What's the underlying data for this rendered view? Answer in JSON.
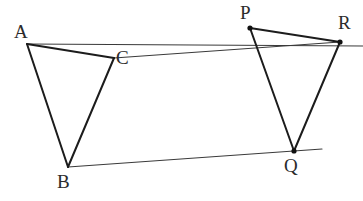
{
  "figure": {
    "kind": "geometry-diagram",
    "width": 363,
    "height": 201,
    "background_color": "#ffffff",
    "stroke_color": "#1c1c1c",
    "thin_stroke_color": "#3a3a3a",
    "label_color": "#2b2b2b",
    "thick_stroke_width": 2.0,
    "thin_stroke_width": 1.0,
    "vertex_dot_radius": 2.6,
    "points": [
      {
        "name": "A",
        "x": 27,
        "y": 44,
        "label": "A",
        "label_x": 14,
        "label_y": 22,
        "dot": false
      },
      {
        "name": "B",
        "x": 68,
        "y": 167,
        "label": "B",
        "label_x": 57,
        "label_y": 172,
        "dot": false
      },
      {
        "name": "C",
        "x": 114,
        "y": 58,
        "label": "C",
        "label_x": 116,
        "label_y": 48,
        "dot": false
      },
      {
        "name": "P",
        "x": 250,
        "y": 28,
        "label": "P",
        "label_x": 240,
        "label_y": 3,
        "dot": true
      },
      {
        "name": "Q",
        "x": 294,
        "y": 151,
        "label": "Q",
        "label_x": 284,
        "label_y": 156,
        "dot": true
      },
      {
        "name": "R",
        "x": 340,
        "y": 42,
        "label": "R",
        "label_x": 338,
        "label_y": 13,
        "dot": true
      }
    ],
    "triangles": [
      {
        "name": "triangle-ABC",
        "vertices": [
          "A",
          "B",
          "C"
        ]
      },
      {
        "name": "triangle-PQR",
        "vertices": [
          "P",
          "Q",
          "R"
        ]
      }
    ],
    "guide_lines": [
      {
        "name": "upper-parallel-line-through-A-P-R",
        "x1": 27,
        "y1": 44,
        "x2": 363,
        "y2": 46
      },
      {
        "name": "mid-parallel-line-through-C-R",
        "x1": 114,
        "y1": 58,
        "x2": 340,
        "y2": 42
      },
      {
        "name": "lower-parallel-line-through-B-Q",
        "x1": 68,
        "y1": 167,
        "x2": 322,
        "y2": 149
      }
    ]
  }
}
